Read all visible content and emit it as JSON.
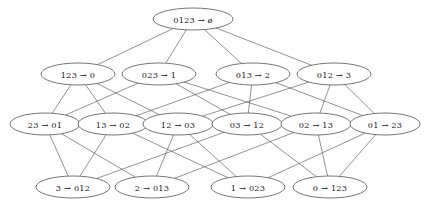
{
  "diagram": {
    "type": "hasse-diagram",
    "background_color": "#ffffff",
    "node_fill": "#ffffff",
    "node_stroke": "#3c3c3c",
    "edge_color": "#4a4a4a",
    "label_color": "#1a1a1a",
    "arrow_glyph": "→",
    "empty_set_glyph": "ø",
    "rows": [
      {
        "rank": 0,
        "y": 19,
        "nodes": [
          {
            "id": "n0",
            "label": "0123 → ø",
            "x": 193,
            "rx": 40,
            "ry": 11
          }
        ]
      },
      {
        "rank": 1,
        "y": 74,
        "nodes": [
          {
            "id": "n1",
            "label": "123 → 0",
            "x": 78,
            "rx": 37,
            "ry": 11
          },
          {
            "id": "n2",
            "label": "023 → 1",
            "x": 159,
            "rx": 37,
            "ry": 11
          },
          {
            "id": "n3",
            "label": "013 → 2",
            "x": 253,
            "rx": 37,
            "ry": 11
          },
          {
            "id": "n4",
            "label": "012 → 3",
            "x": 334,
            "rx": 37,
            "ry": 11
          }
        ]
      },
      {
        "rank": 2,
        "y": 124,
        "nodes": [
          {
            "id": "n5",
            "label": "23 → 01",
            "x": 45,
            "rx": 35,
            "ry": 11
          },
          {
            "id": "n6",
            "label": "13 → 02",
            "x": 113,
            "rx": 35,
            "ry": 11
          },
          {
            "id": "n7",
            "label": "12 → 03",
            "x": 178,
            "rx": 35,
            "ry": 11
          },
          {
            "id": "n8",
            "label": "03 → 12",
            "x": 247,
            "rx": 35,
            "ry": 11
          },
          {
            "id": "n9",
            "label": "02 → 13",
            "x": 316,
            "rx": 35,
            "ry": 11
          },
          {
            "id": "n10",
            "label": "01 → 23",
            "x": 385,
            "rx": 35,
            "ry": 11
          }
        ]
      },
      {
        "rank": 3,
        "y": 187,
        "nodes": [
          {
            "id": "n11",
            "label": "3 → 012",
            "x": 73,
            "rx": 37,
            "ry": 11
          },
          {
            "id": "n12",
            "label": "2 → 013",
            "x": 152,
            "rx": 37,
            "ry": 11
          },
          {
            "id": "n13",
            "label": "1 → 023",
            "x": 248,
            "rx": 37,
            "ry": 11
          },
          {
            "id": "n14",
            "label": "0 → 123",
            "x": 330,
            "rx": 37,
            "ry": 11
          }
        ]
      }
    ],
    "edges": [
      {
        "from": "n0",
        "to": "n1"
      },
      {
        "from": "n0",
        "to": "n2"
      },
      {
        "from": "n0",
        "to": "n3"
      },
      {
        "from": "n0",
        "to": "n4"
      },
      {
        "from": "n1",
        "to": "n5"
      },
      {
        "from": "n1",
        "to": "n6"
      },
      {
        "from": "n1",
        "to": "n7"
      },
      {
        "from": "n2",
        "to": "n5"
      },
      {
        "from": "n2",
        "to": "n8"
      },
      {
        "from": "n2",
        "to": "n9"
      },
      {
        "from": "n3",
        "to": "n6"
      },
      {
        "from": "n3",
        "to": "n8"
      },
      {
        "from": "n3",
        "to": "n10"
      },
      {
        "from": "n4",
        "to": "n7"
      },
      {
        "from": "n4",
        "to": "n9"
      },
      {
        "from": "n4",
        "to": "n10"
      },
      {
        "from": "n5",
        "to": "n11"
      },
      {
        "from": "n5",
        "to": "n12"
      },
      {
        "from": "n6",
        "to": "n11"
      },
      {
        "from": "n6",
        "to": "n13"
      },
      {
        "from": "n7",
        "to": "n12"
      },
      {
        "from": "n7",
        "to": "n13"
      },
      {
        "from": "n8",
        "to": "n11"
      },
      {
        "from": "n8",
        "to": "n14"
      },
      {
        "from": "n9",
        "to": "n12"
      },
      {
        "from": "n9",
        "to": "n14"
      },
      {
        "from": "n10",
        "to": "n13"
      },
      {
        "from": "n10",
        "to": "n14"
      }
    ]
  }
}
